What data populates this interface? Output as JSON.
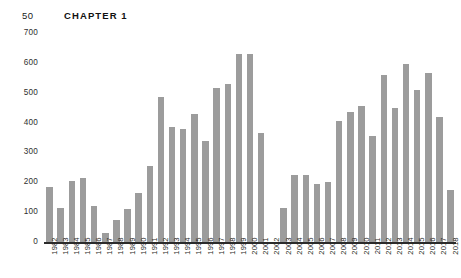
{
  "page": {
    "folio": "50",
    "chapter_header": "CHAPTER 1"
  },
  "style": {
    "bar_color": "#9c9c9c",
    "axis_color": "#2b2b2b",
    "text_color": "#2f2f2f",
    "background": "#ffffff"
  },
  "chart_data": {
    "type": "bar",
    "title": "",
    "xlabel": "",
    "ylabel": "",
    "ylim": [
      0,
      700
    ],
    "yticks": [
      0,
      100,
      200,
      300,
      400,
      500,
      600,
      700
    ],
    "ytick_labels": [
      "0",
      "100",
      "200",
      "300",
      "400",
      "500",
      "600",
      "700"
    ],
    "grid": false,
    "legend": "none",
    "categories": [
      "1982",
      "1983",
      "1984",
      "1985",
      "1986",
      "1987",
      "1988",
      "1989",
      "1990",
      "1991",
      "1992",
      "1993",
      "1994",
      "1995",
      "1996",
      "1997",
      "1998",
      "1999",
      "2000",
      "2001",
      "2002",
      "2003",
      "2004",
      "2005",
      "2006",
      "2007",
      "2008",
      "2009",
      "2010",
      "2011",
      "2012",
      "2013",
      "2014",
      "2015",
      "2016",
      "2017",
      "2018"
    ],
    "values": [
      185,
      115,
      205,
      215,
      120,
      30,
      75,
      110,
      165,
      255,
      485,
      385,
      380,
      430,
      340,
      515,
      530,
      630,
      630,
      365,
      0,
      115,
      225,
      225,
      195,
      200,
      405,
      435,
      455,
      355,
      560,
      450,
      595,
      510,
      565,
      420,
      175
    ]
  }
}
